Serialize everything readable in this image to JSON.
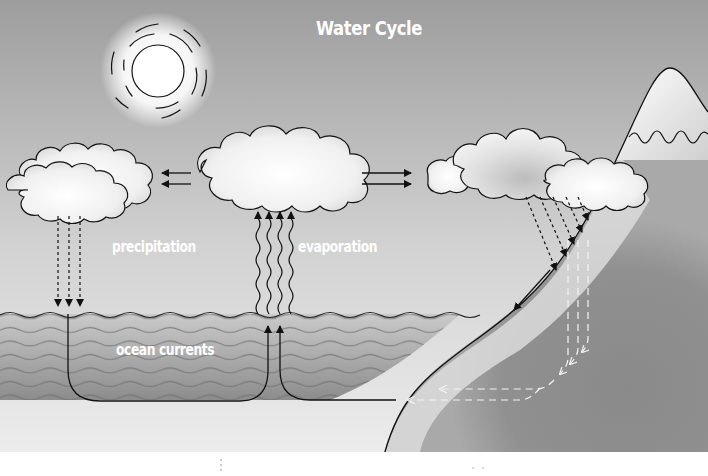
{
  "diagram": {
    "title": "Water Cycle",
    "labels": {
      "precipitation": "precipitation",
      "evaporation": "evaporation",
      "ocean_currents": "ocean currents"
    },
    "elements": [
      {
        "id": "sun",
        "type": "sun-icon"
      },
      {
        "id": "cloud-left",
        "type": "cloud"
      },
      {
        "id": "cloud-center",
        "type": "cloud"
      },
      {
        "id": "cloud-right",
        "type": "cloud"
      },
      {
        "id": "mountain",
        "type": "snow-capped-mountain"
      },
      {
        "id": "ocean",
        "type": "wavy-water"
      },
      {
        "id": "land",
        "type": "land-slope"
      }
    ],
    "flows": [
      {
        "from": "cloud-center",
        "to": "cloud-left",
        "style": "solid-arrows",
        "count": 2
      },
      {
        "from": "cloud-center",
        "to": "cloud-right",
        "style": "solid-arrows",
        "count": 2
      },
      {
        "from": "cloud-left",
        "to": "ocean",
        "style": "dashed-arrows",
        "label": "precipitation",
        "count": 3
      },
      {
        "from": "ocean",
        "to": "cloud-center",
        "style": "wavy-arrows",
        "label": "evaporation",
        "count": 4
      },
      {
        "from": "cloud-right",
        "to": "mountain-slope",
        "style": "dashed-arrows",
        "count": 5
      },
      {
        "from": "mountain-slope",
        "to": "ocean",
        "style": "solid-arrow",
        "label": "runoff"
      },
      {
        "from": "land",
        "to": "ocean",
        "style": "white-dashed-arrows",
        "label": "groundwater",
        "count": 3
      },
      {
        "from": "ocean",
        "to": "ocean",
        "style": "solid-loop-arrows",
        "label": "ocean currents"
      }
    ],
    "colors": {
      "sky_top": "#9a9a9a",
      "sky_bottom": "#e6e6e6",
      "water_top": "#c4c4c4",
      "water_bottom": "#8e8e8e",
      "land": "#8a8a8a",
      "land_highlight": "#d9d9d9",
      "line": "#111111",
      "label": "#ffffff"
    }
  }
}
